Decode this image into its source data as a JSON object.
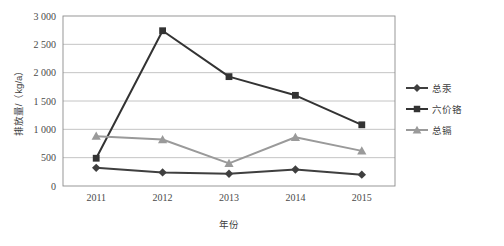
{
  "chart_data": {
    "type": "line",
    "title": "",
    "xlabel": "年份",
    "ylabel": "排放量/（kg/a）",
    "categories": [
      "2011",
      "2012",
      "2013",
      "2014",
      "2015"
    ],
    "x_tick_labels": [
      "2011",
      "2012",
      "2013",
      "2014",
      "2015"
    ],
    "y_tick_labels": [
      "0",
      "500",
      "1 000",
      "1 500",
      "2 000",
      "2 500",
      "3 000"
    ],
    "y_tick_values": [
      0,
      500,
      1000,
      1500,
      2000,
      2500,
      3000
    ],
    "ylim": [
      0,
      3000
    ],
    "grid": "horizontal",
    "legend_position": "right",
    "series": [
      {
        "name": "总汞",
        "marker": "diamond",
        "color": "#3f3f3f",
        "values": [
          320,
          240,
          215,
          290,
          200
        ]
      },
      {
        "name": "六价铬",
        "marker": "square",
        "color": "#333333",
        "values": [
          490,
          2740,
          1930,
          1600,
          1080
        ]
      },
      {
        "name": "总镉",
        "marker": "triangle",
        "color": "#9a9a9a",
        "values": [
          880,
          820,
          400,
          860,
          620
        ]
      }
    ]
  },
  "colors": {
    "plot_border": "#8c8c8c",
    "gridline": "#b5b5b5",
    "background": "#ffffff",
    "text": "#3d3d3d"
  }
}
